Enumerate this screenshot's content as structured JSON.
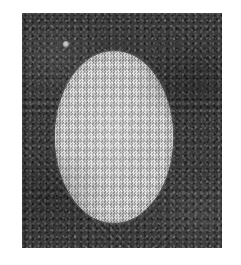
{
  "image": {
    "kind": "halftone-photographic-plate",
    "caption": "",
    "canvas": {
      "width_px": 241,
      "height_px": 265,
      "background_color": "#ffffff"
    },
    "plate_field": {
      "label": "dark background field",
      "x_px": 22,
      "y_px": 13,
      "width_px": 200,
      "height_px": 235,
      "fill_color": "#3b3b3b",
      "texture": "film-grain-noise"
    },
    "specimen": {
      "label": "light oval specimen",
      "shape": "ellipse",
      "center_x_px": 114,
      "center_y_px": 137,
      "width_px": 118,
      "height_px": 172,
      "fill_color": "#b9b9b9",
      "texture": "checkerboard-halftone-dither",
      "edge": "soft"
    },
    "speck": {
      "label": "small bright speck",
      "center_x_px": 66,
      "center_y_px": 44,
      "width_px": 6,
      "height_px": 7,
      "fill_color": "#d0d0d0"
    },
    "margins": {
      "left_px": 22,
      "top_px": 13,
      "right_px": 19,
      "bottom_px": 17,
      "color": "#ffffff"
    },
    "palette": {
      "paper": "#ffffff",
      "field_dark": "#3b3b3b",
      "specimen_light": "#b9b9b9",
      "speck_light": "#d0d0d0"
    }
  }
}
